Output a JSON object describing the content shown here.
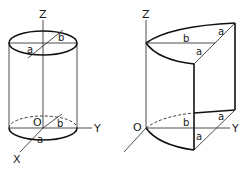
{
  "figures": [
    {
      "name": "elliptic-cylinder",
      "axes": {
        "z": "Z",
        "y": "Y",
        "x": "X",
        "origin": "O"
      },
      "top_labels": {
        "semi_major": "b",
        "semi_minor": "a"
      },
      "bottom_labels": {
        "semi_major": "b",
        "semi_minor": "a"
      }
    },
    {
      "name": "parabolic-cylinder-section",
      "axes": {
        "z": "Z",
        "y": "Y",
        "origin": "O"
      },
      "top_labels": {
        "horizontal": "b",
        "diag_upper": "a",
        "diag_lower": "a"
      },
      "bottom_labels": {
        "horizontal": "b",
        "diag_upper": "a",
        "diag_lower": "a"
      }
    }
  ],
  "colors": {
    "line": "#111111",
    "background": "#ffffff"
  }
}
